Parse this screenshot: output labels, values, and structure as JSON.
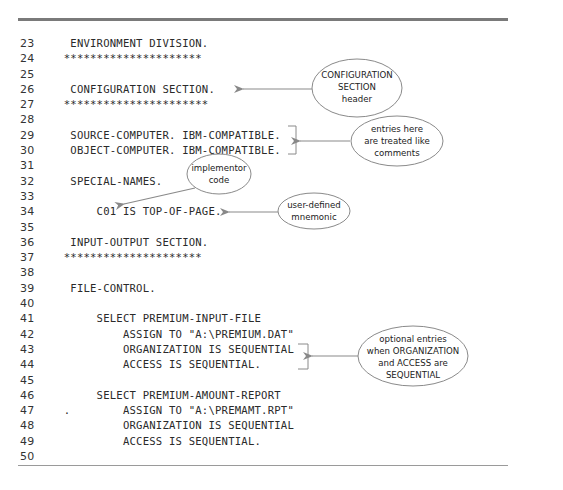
{
  "code_lines": [
    {
      "num": "23",
      "text": "    ENVIRONMENT DIVISION."
    },
    {
      "num": "24",
      "text": "   *********************"
    },
    {
      "num": "25",
      "text": ""
    },
    {
      "num": "26",
      "text": "    CONFIGURATION SECTION."
    },
    {
      "num": "27",
      "text": "   **********************"
    },
    {
      "num": "28",
      "text": ""
    },
    {
      "num": "29",
      "text": "    SOURCE-COMPUTER. IBM-COMPATIBLE."
    },
    {
      "num": "30",
      "text": "    OBJECT-COMPUTER. IBM-COMPATIBLE."
    },
    {
      "num": "31",
      "text": ""
    },
    {
      "num": "32",
      "text": "    SPECIAL-NAMES."
    },
    {
      "num": "33",
      "text": ""
    },
    {
      "num": "34",
      "text": "        C01 IS TOP-OF-PAGE."
    },
    {
      "num": "35",
      "text": ""
    },
    {
      "num": "36",
      "text": "    INPUT-OUTPUT SECTION."
    },
    {
      "num": "37",
      "text": "   *********************"
    },
    {
      "num": "38",
      "text": ""
    },
    {
      "num": "39",
      "text": "    FILE-CONTROL."
    },
    {
      "num": "40",
      "text": ""
    },
    {
      "num": "41",
      "text": "        SELECT PREMIUM-INPUT-FILE"
    },
    {
      "num": "42",
      "text": "            ASSIGN TO \"A:\\PREMIUM.DAT\""
    },
    {
      "num": "43",
      "text": "            ORGANIZATION IS SEQUENTIAL"
    },
    {
      "num": "44",
      "text": "            ACCESS IS SEQUENTIAL."
    },
    {
      "num": "45",
      "text": ""
    },
    {
      "num": "46",
      "text": "        SELECT PREMIUM-AMOUNT-REPORT"
    },
    {
      "num": "47",
      "text": "   .        ASSIGN TO \"A:\\PREMAMT.RPT\""
    },
    {
      "num": "48",
      "text": "            ORGANIZATION IS SEQUENTIAL"
    },
    {
      "num": "49",
      "text": "            ACCESS IS SEQUENTIAL."
    },
    {
      "num": "50",
      "text": ""
    }
  ],
  "callouts": {
    "config_header": [
      "CONFIGURATION",
      "SECTION",
      "header"
    ],
    "comments": [
      "entries here",
      "are treated like",
      "comments"
    ],
    "implementor": [
      "implementor",
      "code"
    ],
    "mnemonic": [
      "user-defined",
      "mnemonic"
    ],
    "optional": [
      "optional entries",
      "when ORGANIZATION",
      "and ACCESS are",
      "SEQUENTIAL"
    ]
  },
  "colors": {
    "rule": "#7a7a7a",
    "arrow": "#8a8a8a",
    "ellipse_stroke": "#8a8a8a",
    "text": "#2a2a2a"
  }
}
